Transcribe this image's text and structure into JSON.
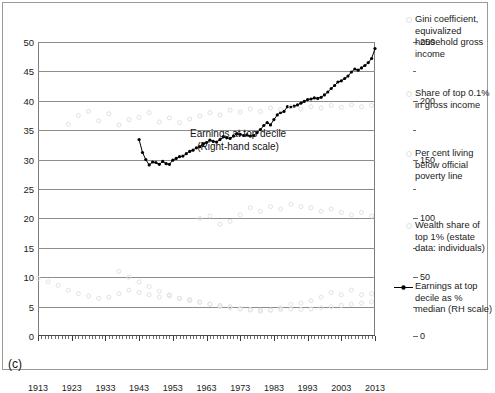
{
  "caption": "(c)",
  "annotation": {
    "line1": "Earnings at top decile",
    "line2": "(Right-hand scale)"
  },
  "axes": {
    "left_ticks": [
      "0",
      "5",
      "10",
      "15",
      "20",
      "25",
      "30",
      "35",
      "40",
      "45",
      "50"
    ],
    "right_ticks": [
      "0",
      "50",
      "100",
      "150",
      "200",
      "250"
    ],
    "x_ticks": [
      "1913",
      "1923",
      "1933",
      "1943",
      "1953",
      "1963",
      "1973",
      "1983",
      "1993",
      "2003",
      "2013"
    ]
  },
  "sidenotes": [
    {
      "text": "Gini coefficient, equivalized household gross income"
    },
    {
      "text": "Share of top 0.1% in gross income"
    },
    {
      "text": "Per cent living below official poverty line"
    },
    {
      "text": "Wealth share of top 1% (estate data: individuals)"
    }
  ],
  "legend": {
    "marker": "line-marker-icon",
    "text": "Earnings at top decile as % median (RH scale)"
  },
  "colors": {
    "series_main": "#000000",
    "series_faint": "#d9d9d9",
    "grid": "#8d8d8d",
    "frame": "#9a9a9a"
  },
  "chart_data": {
    "type": "line",
    "title": "",
    "xlabel": "",
    "ylabel": "",
    "xlim": [
      1913,
      2013
    ],
    "ylim": [
      0,
      50
    ],
    "y2lim": [
      0,
      250
    ],
    "grid": true,
    "legend_position": "right",
    "series": [
      {
        "name": "Earnings at top decile as % median (RH scale)",
        "axis": "right",
        "style": "line+markers",
        "color": "#000000",
        "x": [
          1943,
          1944,
          1945,
          1946,
          1947,
          1948,
          1949,
          1950,
          1951,
          1952,
          1953,
          1954,
          1955,
          1956,
          1957,
          1958,
          1959,
          1960,
          1961,
          1962,
          1963,
          1964,
          1965,
          1966,
          1967,
          1968,
          1969,
          1970,
          1971,
          1972,
          1973,
          1974,
          1975,
          1976,
          1977,
          1978,
          1979,
          1980,
          1981,
          1982,
          1983,
          1984,
          1985,
          1986,
          1987,
          1988,
          1989,
          1990,
          1991,
          1992,
          1993,
          1994,
          1995,
          1996,
          1997,
          1998,
          1999,
          2000,
          2001,
          2002,
          2003,
          2004,
          2005,
          2006,
          2007,
          2008,
          2009,
          2010,
          2011,
          2012,
          2013
        ],
        "values_left_scale": [
          33.4,
          31.2,
          30.0,
          29.1,
          29.6,
          29.5,
          29.2,
          29.7,
          29.3,
          29.2,
          29.9,
          30.2,
          30.5,
          30.6,
          31.0,
          31.4,
          31.6,
          32.0,
          32.2,
          32.6,
          32.9,
          33.3,
          33.1,
          33.0,
          33.4,
          33.9,
          33.7,
          33.6,
          34.0,
          34.4,
          34.3,
          34.1,
          34.2,
          34.0,
          34.1,
          34.6,
          35.1,
          35.8,
          36.3,
          35.9,
          36.8,
          37.6,
          38.0,
          38.2,
          39.0,
          38.9,
          39.1,
          39.3,
          39.6,
          39.9,
          40.2,
          40.3,
          40.5,
          40.4,
          40.6,
          41.0,
          41.5,
          42.1,
          42.6,
          43.2,
          43.4,
          43.8,
          44.2,
          44.9,
          45.4,
          45.2,
          45.6,
          46.0,
          46.5,
          47.2,
          48.9
        ],
        "values": [
          167,
          156,
          150,
          146,
          148,
          148,
          146,
          149,
          147,
          146,
          150,
          151,
          153,
          153,
          155,
          157,
          158,
          160,
          161,
          163,
          165,
          167,
          166,
          165,
          167,
          170,
          169,
          168,
          170,
          172,
          172,
          171,
          171,
          170,
          171,
          173,
          176,
          179,
          182,
          180,
          184,
          188,
          190,
          191,
          195,
          195,
          196,
          197,
          198,
          200,
          201,
          202,
          203,
          202,
          203,
          205,
          208,
          211,
          213,
          216,
          217,
          219,
          221,
          225,
          227,
          226,
          228,
          230,
          233,
          236,
          245
        ]
      },
      {
        "name": "Gini coefficient, equivalized household gross income",
        "axis": "left",
        "style": "markers",
        "color": "#e0e0e0",
        "x": [
          1922,
          1925,
          1928,
          1931,
          1934,
          1937,
          1940,
          1943,
          1946,
          1949,
          1952,
          1955,
          1958,
          1961,
          1964,
          1967,
          1970,
          1973,
          1976,
          1979,
          1982,
          1985,
          1988,
          1991,
          1994,
          1997,
          2000,
          2003,
          2006,
          2009,
          2012
        ],
        "values": [
          36.0,
          37.5,
          38.2,
          36.6,
          37.8,
          35.9,
          36.8,
          37.2,
          38.0,
          36.4,
          37.1,
          36.3,
          36.9,
          37.4,
          38.0,
          37.6,
          38.4,
          38.1,
          38.6,
          38.2,
          38.8,
          38.5,
          39.0,
          38.6,
          39.0,
          38.8,
          39.2,
          38.9,
          39.3,
          39.0,
          39.2
        ]
      },
      {
        "name": "Share of top 0.1% in gross income",
        "axis": "left",
        "style": "markers",
        "color": "#e2e2e2",
        "x": [
          1937,
          1940,
          1943,
          1946,
          1949,
          1952,
          1955,
          1958,
          1961,
          1964,
          1967,
          1970,
          1973,
          1976,
          1979,
          1982,
          1985,
          1988,
          1991,
          1994,
          1997,
          2000,
          2003,
          2006,
          2009,
          2012
        ],
        "values": [
          11.0,
          10.0,
          9.2,
          8.4,
          7.6,
          7.0,
          6.4,
          6.0,
          5.7,
          5.4,
          5.2,
          5.0,
          4.7,
          4.4,
          4.2,
          4.4,
          4.8,
          5.4,
          5.6,
          6.0,
          6.6,
          7.4,
          7.0,
          7.8,
          7.0,
          7.2
        ]
      },
      {
        "name": "Per cent living below official poverty line",
        "axis": "left",
        "style": "markers",
        "color": "#e2e2e2",
        "x": [
          1961,
          1964,
          1967,
          1970,
          1973,
          1976,
          1979,
          1982,
          1985,
          1988,
          1991,
          1994,
          1997,
          2000,
          2003,
          2006,
          2009,
          2012
        ],
        "values": [
          20.0,
          20.4,
          19.0,
          19.5,
          20.6,
          21.8,
          21.2,
          22.0,
          21.6,
          22.4,
          22.0,
          21.8,
          21.2,
          21.6,
          21.0,
          20.6,
          21.0,
          20.4
        ]
      },
      {
        "name": "Wealth share of top 1% (estate data: individuals)",
        "axis": "left",
        "style": "markers",
        "color": "#e2e2e2",
        "x": [
          1913,
          1916,
          1919,
          1922,
          1925,
          1928,
          1931,
          1934,
          1937,
          1940,
          1943,
          1946,
          1949,
          1952,
          1955,
          1958,
          1961,
          1964,
          1967,
          1970,
          1973,
          1976,
          1979,
          1982,
          1985,
          1988,
          1991,
          1994,
          1997,
          2000,
          2003,
          2006,
          2009,
          2012
        ],
        "values": [
          9.8,
          9.2,
          8.6,
          7.8,
          7.2,
          6.8,
          6.4,
          6.6,
          7.2,
          7.8,
          7.4,
          7.0,
          6.6,
          6.8,
          6.4,
          6.2,
          5.8,
          5.4,
          5.0,
          4.8,
          4.6,
          4.5,
          4.4,
          4.4,
          4.5,
          4.6,
          4.5,
          4.6,
          4.8,
          5.0,
          5.2,
          5.4,
          5.6,
          5.8
        ]
      }
    ]
  }
}
